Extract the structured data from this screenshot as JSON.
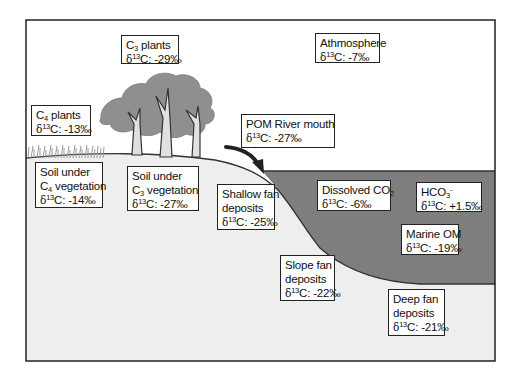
{
  "diagram": {
    "colors": {
      "sky": "#ffffff",
      "land": "#eeeeee",
      "seawater": "#7e7e7e",
      "tree_canopy": "#8f8f8f",
      "frame": "#222222",
      "text": "#111111"
    },
    "labels": {
      "c3_plants": {
        "name_pre": "C",
        "name_sub": "3",
        "name_post": " plants",
        "delta_pre": "δ",
        "delta_sup": "13",
        "delta_post": "C: -29‰"
      },
      "atmosphere": {
        "name": "Athmosphere",
        "delta_pre": "δ",
        "delta_sup": "13",
        "delta_post": "C: -7‰"
      },
      "c4_plants": {
        "name_pre": "C",
        "name_sub": "4",
        "name_post": " plants",
        "delta_pre": "δ",
        "delta_sup": "13",
        "delta_post": "C: -13‰"
      },
      "pom_river_mouth": {
        "name": "POM River mouth",
        "delta_pre": "δ",
        "delta_sup": "13",
        "delta_post": "C: -27‰"
      },
      "soil_c4": {
        "line1": "Soil under",
        "name_pre": "C",
        "name_sub": "4",
        "name_post": " vegetation",
        "delta_pre": "δ",
        "delta_sup": "13",
        "delta_post": "C: -14‰"
      },
      "soil_c3": {
        "line1": "Soil under",
        "name_pre": "C",
        "name_sub": "3",
        "name_post": " vegetation",
        "delta_pre": "δ",
        "delta_sup": "13",
        "delta_post": "C: -27‰"
      },
      "shallow_fan": {
        "line1": "Shallow fan",
        "line2": "deposits",
        "delta_pre": "δ",
        "delta_sup": "13",
        "delta_post": "C: -25‰"
      },
      "dissolved_co2": {
        "name_pre": "Dissolved CO",
        "name_sub": "2",
        "delta_pre": "δ",
        "delta_sup": "13",
        "delta_post": "C: -6‰"
      },
      "hco3": {
        "name_pre": "HCO",
        "name_sub": "3",
        "name_sup": "-",
        "delta_pre": "δ",
        "delta_sup": "13",
        "delta_post": "C: +1.5‰"
      },
      "marine_om": {
        "name": "Marine OM",
        "delta_pre": "δ",
        "delta_sup": "13",
        "delta_post": "C: -19‰"
      },
      "slope_fan": {
        "line1": "Slope fan",
        "line2": "deposits",
        "delta_pre": "δ",
        "delta_sup": "13",
        "delta_post": "C: -22‰"
      },
      "deep_fan": {
        "line1": "Deep fan",
        "line2": "deposits",
        "delta_pre": "δ",
        "delta_sup": "13",
        "delta_post": "C: -21‰"
      }
    }
  }
}
